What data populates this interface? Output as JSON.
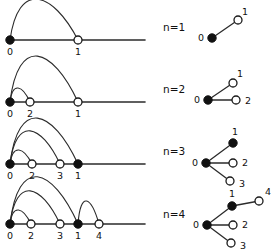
{
  "figure": {
    "colors": {
      "stroke": "#2b2b2b",
      "filled_node": "#111111",
      "open_node_fill": "#ffffff",
      "background": "#ffffff",
      "text": "#111111"
    },
    "rows": [
      {
        "id": "row-n1",
        "n_label": "n=1",
        "n_label_x": 163,
        "n_label_y": 28,
        "linear": {
          "baseline_y": 40,
          "x_start": 10,
          "x_end": 145,
          "nodes": [
            {
              "label": "0",
              "x": 10,
              "y": 40,
              "type": "filled",
              "label_x": 10,
              "label_y": 52
            },
            {
              "label": "1",
              "x": 78,
              "y": 40,
              "type": "open",
              "label_x": 78,
              "label_y": 52
            }
          ],
          "arcs": [
            {
              "from_x": 10,
              "to_x": 78,
              "height": 32
            }
          ]
        },
        "tree": {
          "nodes": [
            {
              "label": "0",
              "x": 212,
              "y": 38,
              "type": "filled",
              "label_x": 201,
              "label_y": 38
            },
            {
              "label": "1",
              "x": 238,
              "y": 20,
              "type": "open",
              "label_x": 245,
              "label_y": 12
            }
          ],
          "edges": [
            {
              "x1": 212,
              "y1": 38,
              "x2": 238,
              "y2": 20
            }
          ]
        }
      },
      {
        "id": "row-n2",
        "n_label": "n=2",
        "n_label_x": 163,
        "n_label_y": 90,
        "linear": {
          "baseline_y": 102,
          "x_start": 10,
          "x_end": 145,
          "nodes": [
            {
              "label": "0",
              "x": 10,
              "y": 102,
              "type": "filled",
              "label_x": 10,
              "label_y": 114
            },
            {
              "label": "2",
              "x": 30,
              "y": 102,
              "type": "open",
              "label_x": 30,
              "label_y": 114
            },
            {
              "label": "1",
              "x": 78,
              "y": 102,
              "type": "open",
              "label_x": 78,
              "label_y": 114
            }
          ],
          "arcs": [
            {
              "from_x": 10,
              "to_x": 30,
              "height": 11
            },
            {
              "from_x": 10,
              "to_x": 78,
              "height": 36
            }
          ]
        },
        "tree": {
          "nodes": [
            {
              "label": "0",
              "x": 208,
              "y": 100,
              "type": "filled",
              "label_x": 197,
              "label_y": 100
            },
            {
              "label": "1",
              "x": 233,
              "y": 83,
              "type": "open",
              "label_x": 240,
              "label_y": 74
            },
            {
              "label": "2",
              "x": 236,
              "y": 100,
              "type": "open",
              "label_x": 248,
              "label_y": 101
            }
          ],
          "edges": [
            {
              "x1": 208,
              "y1": 100,
              "x2": 233,
              "y2": 83
            },
            {
              "x1": 208,
              "y1": 100,
              "x2": 236,
              "y2": 100
            }
          ]
        }
      },
      {
        "id": "row-n3",
        "n_label": "n=3",
        "n_label_x": 163,
        "n_label_y": 152,
        "linear": {
          "baseline_y": 164,
          "x_start": 10,
          "x_end": 145,
          "nodes": [
            {
              "label": "0",
              "x": 10,
              "y": 164,
              "type": "filled",
              "label_x": 10,
              "label_y": 176
            },
            {
              "label": "2",
              "x": 32,
              "y": 164,
              "type": "open",
              "label_x": 32,
              "label_y": 176
            },
            {
              "label": "3",
              "x": 60,
              "y": 164,
              "type": "open",
              "label_x": 60,
              "label_y": 176
            },
            {
              "label": "1",
              "x": 78,
              "y": 164,
              "type": "filled",
              "label_x": 78,
              "label_y": 176
            }
          ],
          "arcs": [
            {
              "from_x": 10,
              "to_x": 32,
              "height": 11
            },
            {
              "from_x": 10,
              "to_x": 60,
              "height": 26
            },
            {
              "from_x": 10,
              "to_x": 78,
              "height": 36
            }
          ]
        },
        "tree": {
          "nodes": [
            {
              "label": "0",
              "x": 206,
              "y": 163,
              "type": "filled",
              "label_x": 195,
              "label_y": 163
            },
            {
              "label": "1",
              "x": 233,
              "y": 143,
              "type": "filled",
              "label_x": 235,
              "label_y": 132
            },
            {
              "label": "2",
              "x": 233,
              "y": 163,
              "type": "open",
              "label_x": 245,
              "label_y": 163
            },
            {
              "label": "3",
              "x": 230,
              "y": 181,
              "type": "open",
              "label_x": 242,
              "label_y": 184
            }
          ],
          "edges": [
            {
              "x1": 206,
              "y1": 163,
              "x2": 233,
              "y2": 143
            },
            {
              "x1": 206,
              "y1": 163,
              "x2": 233,
              "y2": 163
            },
            {
              "x1": 206,
              "y1": 163,
              "x2": 230,
              "y2": 181
            }
          ]
        }
      },
      {
        "id": "row-n4",
        "n_label": "n=4",
        "n_label_x": 163,
        "n_label_y": 215,
        "linear": {
          "baseline_y": 224,
          "x_start": 10,
          "x_end": 145,
          "nodes": [
            {
              "label": "0",
              "x": 10,
              "y": 224,
              "type": "filled",
              "label_x": 10,
              "label_y": 236
            },
            {
              "label": "2",
              "x": 31,
              "y": 224,
              "type": "open",
              "label_x": 31,
              "label_y": 236
            },
            {
              "label": "3",
              "x": 60,
              "y": 224,
              "type": "open",
              "label_x": 60,
              "label_y": 236
            },
            {
              "label": "1",
              "x": 78,
              "y": 224,
              "type": "filled",
              "label_x": 78,
              "label_y": 236
            },
            {
              "label": "4",
              "x": 99,
              "y": 224,
              "type": "open",
              "label_x": 99,
              "label_y": 236
            }
          ],
          "arcs": [
            {
              "from_x": 10,
              "to_x": 31,
              "height": 11
            },
            {
              "from_x": 10,
              "to_x": 60,
              "height": 26
            },
            {
              "from_x": 10,
              "to_x": 78,
              "height": 37
            },
            {
              "from_x": 78,
              "to_x": 99,
              "height": 18
            }
          ]
        },
        "tree": {
          "nodes": [
            {
              "label": "0",
              "x": 207,
              "y": 225,
              "type": "filled",
              "label_x": 196,
              "label_y": 225
            },
            {
              "label": "1",
              "x": 232,
              "y": 206,
              "type": "filled",
              "label_x": 232,
              "label_y": 194
            },
            {
              "label": "4",
              "x": 259,
              "y": 201,
              "type": "open",
              "label_x": 268,
              "label_y": 192
            },
            {
              "label": "2",
              "x": 233,
              "y": 225,
              "type": "open",
              "label_x": 245,
              "label_y": 225
            },
            {
              "label": "3",
              "x": 231,
              "y": 243,
              "type": "open",
              "label_x": 243,
              "label_y": 246
            }
          ],
          "edges": [
            {
              "x1": 207,
              "y1": 225,
              "x2": 232,
              "y2": 206
            },
            {
              "x1": 232,
              "y1": 206,
              "x2": 259,
              "y2": 201
            },
            {
              "x1": 207,
              "y1": 225,
              "x2": 233,
              "y2": 225
            },
            {
              "x1": 207,
              "y1": 225,
              "x2": 231,
              "y2": 243
            }
          ]
        }
      }
    ],
    "node_radius": {
      "filled": 4.2,
      "open": 4.0
    }
  }
}
